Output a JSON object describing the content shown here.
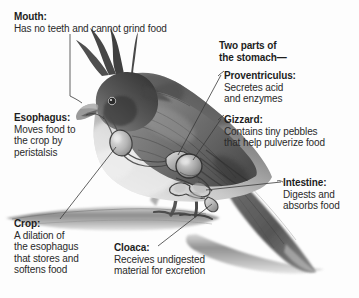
{
  "diagram": {
    "background_color": "#fdfdfd",
    "text_color": "#1d1d1d"
  },
  "callouts": [
    {
      "key": "mouth",
      "header": "Mouth:",
      "lines": [
        "Has no teeth and cannot grind food"
      ]
    },
    {
      "key": "esophagus",
      "header": "Esophagus:",
      "lines": [
        "Moves food to",
        "the crop by",
        "peristalsis"
      ]
    },
    {
      "key": "crop",
      "header": "Crop:",
      "lines": [
        "A dilation of",
        "the esophagus",
        "that stores and",
        "softens food"
      ]
    },
    {
      "key": "stomach",
      "header": "Two parts of",
      "lines": [
        "the stomach—"
      ]
    },
    {
      "key": "proventriculus",
      "header": "Proventriculus:",
      "lines": [
        "Secretes acid",
        "and enzymes"
      ]
    },
    {
      "key": "gizzard",
      "header": "Gizzard:",
      "lines": [
        "Contains tiny pebbles",
        "that help pulverize food"
      ]
    },
    {
      "key": "intestine",
      "header": "Intestine:",
      "lines": [
        "Digests and",
        "absorbs food"
      ]
    },
    {
      "key": "cloaca",
      "header": "Cloaca:",
      "lines": [
        "Receives undigested",
        "material for excretion"
      ]
    }
  ]
}
